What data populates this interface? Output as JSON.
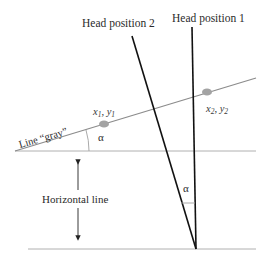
{
  "diagram": {
    "labels": {
      "head_position_1": "Head position 1",
      "head_position_2": "Head position 2",
      "line_gray": "Line “gray”",
      "horizontal_line": "Horizontal line",
      "alpha_1": "α",
      "alpha_2": "α",
      "point1_x": "x",
      "point1_x_sub": "1",
      "point1_sep": ", ",
      "point1_y": "y",
      "point1_y_sub": "1",
      "point2_x": "x",
      "point2_x_sub": "2",
      "point2_sep": ", ",
      "point2_y": "y",
      "point2_y_sub": "2"
    },
    "colors": {
      "gray_line": "#8c8c8c",
      "horizontal_lines": "#a8a8a8",
      "head_lines": "#111111",
      "points": "#a0a0a0",
      "arrow": "#222222"
    }
  }
}
